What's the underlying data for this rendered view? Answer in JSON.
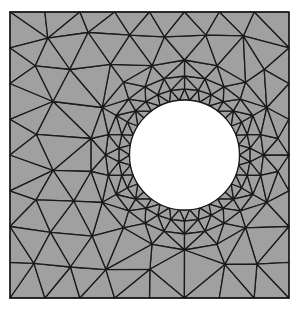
{
  "diagram": {
    "type": "finite-element-triangular-mesh",
    "colors": {
      "background": "#ffffff",
      "fill": "#a0a0a0",
      "edge": "#1a1a1a",
      "hole": "#ffffff"
    },
    "plate": {
      "x0": 10,
      "y0": 12,
      "x1": 289,
      "y1": 298
    },
    "hole": {
      "cx": 184.5,
      "cy": 155,
      "r": 55
    },
    "rings": [
      {
        "offset": 0,
        "count": 34
      },
      {
        "offset": 11,
        "count": 30
      },
      {
        "offset": 24,
        "count": 24
      },
      {
        "offset": 40,
        "count": 18
      }
    ],
    "boundary_spacing": 35,
    "interior_spacing": 38,
    "edge_width": 1.3
  }
}
